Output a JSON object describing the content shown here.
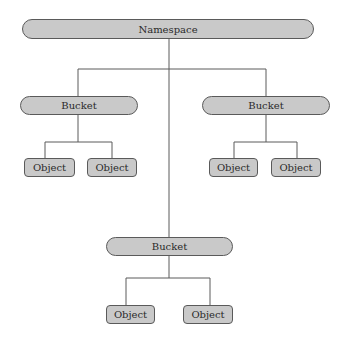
{
  "diagram": {
    "type": "hierarchy",
    "root": {
      "label": "Namespace",
      "children": [
        {
          "label": "Bucket",
          "children": [
            {
              "label": "Object"
            },
            {
              "label": "Object"
            }
          ]
        },
        {
          "label": "Bucket",
          "children": [
            {
              "label": "Object"
            },
            {
              "label": "Object"
            }
          ]
        },
        {
          "label": "Bucket",
          "children": [
            {
              "label": "Object"
            },
            {
              "label": "Object"
            }
          ]
        }
      ]
    }
  },
  "colors": {
    "node_fill": "#c9c9c9",
    "node_border": "#5a5a5a",
    "line": "#5a5a5a",
    "background": "#ffffff"
  }
}
